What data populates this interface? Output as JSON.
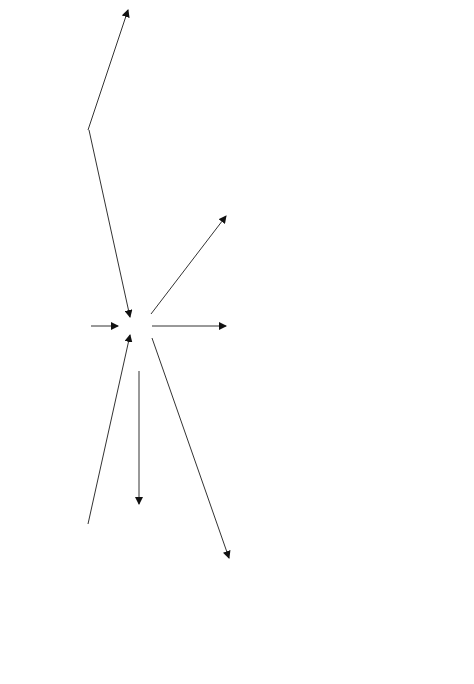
{
  "sources": [
    {
      "id": "2d-gel",
      "label_lines": [
        "Excision of",
        "protein spots",
        "from 2-D gel"
      ]
    },
    {
      "id": "1d-gel",
      "label_lines": [
        "Excision of",
        "protein bands",
        "from 1-D gel"
      ]
    },
    {
      "id": "solution",
      "label_lines": [
        "Enzymatic digestion",
        "of a complex mixture",
        "of proteins in solution"
      ]
    }
  ],
  "hub": {
    "label": "Enzymatic Digestion"
  },
  "affinity_note": {
    "lines": [
      "Optional use of affinity purification",
      "step to simplify the peptide mixture"
    ]
  },
  "methods": [
    {
      "id": "maldi",
      "title": "MALDI-TOF",
      "subtitle": "(Peptide Mass Fingerprinting)",
      "caption_lines": [
        "Initial database query based on",
        "a list of peptide masses"
      ]
    },
    {
      "id": "nanoes",
      "title": "nanoES MS/MS",
      "subtitle": "(Simple Mixtures)",
      "caption_lines": [
        "Database query based on",
        "a single MS/MS spectrum"
      ]
    },
    {
      "id": "lcmsms",
      "title": "LC/MS/MS",
      "subtitle": "(Complex Mixtures)",
      "caption_lines": [
        "Database query based on",
        "multiple MS/MS spectra"
      ]
    }
  ],
  "psd": {
    "title": "Post Source Decay (PSD)",
    "subtitle": "(Selected peptides)",
    "caption_lines": [
      "Used to confirm a",
      "tentative protein ID"
    ]
  },
  "icons": {
    "gel2d": "2d-gel-image-icon",
    "gel1d": "1d-gel-image-icon",
    "tube": "sample-tube-icon",
    "nanospray": "nanospray-emitter-icon",
    "chromatogram": "chromatogram-icon",
    "spectra_stack": "spectra-stack-icon",
    "maldi_spectrum": "mass-spectrum-icon",
    "msms_spectrum": "msms-spectrum-icon"
  }
}
